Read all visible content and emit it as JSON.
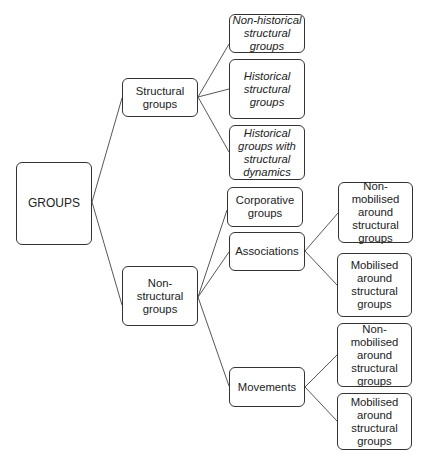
{
  "diagram": {
    "type": "tree",
    "root": "GROUPS",
    "nodes": {
      "groups": "GROUPS",
      "structural": "Structural groups",
      "non_historical": "Non-historical structural groups",
      "historical": "Historical structural groups",
      "historical_dynamics": "Historical groups with structural dynamics",
      "non_structural": "Non-structural groups",
      "corporative": "Corporative groups",
      "associations": "Associations",
      "assoc_non_mobilised": "Non-mobilised around structural groups",
      "assoc_mobilised": "Mobilised around structural groups",
      "movements": "Movements",
      "mov_non_mobilised": "Non-mobilised around structural groups",
      "mov_mobilised": "Mobilised around structural groups"
    },
    "edges": [
      [
        "GROUPS",
        "Structural groups"
      ],
      [
        "GROUPS",
        "Non-structural groups"
      ],
      [
        "Structural groups",
        "Non-historical structural groups"
      ],
      [
        "Structural groups",
        "Historical structural groups"
      ],
      [
        "Structural groups",
        "Historical groups with structural dynamics"
      ],
      [
        "Non-structural groups",
        "Corporative groups"
      ],
      [
        "Non-structural groups",
        "Associations"
      ],
      [
        "Non-structural groups",
        "Movements"
      ],
      [
        "Associations",
        "Non-mobilised around structural groups"
      ],
      [
        "Associations",
        "Mobilised around structural groups"
      ],
      [
        "Movements",
        "Non-mobilised around structural groups"
      ],
      [
        "Movements",
        "Mobilised around structural groups"
      ]
    ],
    "italic_nodes": [
      "non_historical",
      "historical",
      "historical_dynamics"
    ],
    "border_color": "#333333",
    "line_color": "#444444"
  }
}
